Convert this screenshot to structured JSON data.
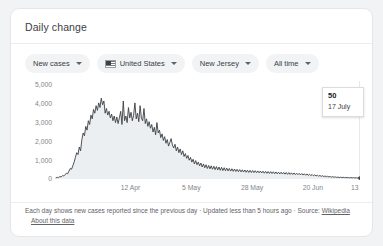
{
  "card": {
    "title": "Daily change"
  },
  "filters": [
    {
      "label": "New cases",
      "icon": null
    },
    {
      "label": "United States",
      "icon": "us-flag-icon"
    },
    {
      "label": "New Jersey",
      "icon": null
    },
    {
      "label": "All time",
      "icon": null
    }
  ],
  "tooltip": {
    "value": "50",
    "date": "17 July"
  },
  "footer": {
    "text": "Each day shows new cases reported since the previous day · Updated less than 5 hours ago ·  Source:",
    "source_link": "Wikipedia",
    "about_link": "About this data"
  },
  "colors": {
    "line": "#3c4043",
    "fill": "#eceff1",
    "axis_text": "#80868b",
    "card_bg": "#ffffff",
    "page_bg": "#f1f3f4",
    "chip_bg": "#f1f3f4"
  },
  "chart_data": {
    "type": "area",
    "title": "Daily change",
    "xlabel": "",
    "ylabel": "",
    "ylim": [
      0,
      5000
    ],
    "yticks": [
      0,
      1000,
      2000,
      3000,
      4000,
      5000
    ],
    "ytick_labels": [
      "0",
      "1,000",
      "2,000",
      "3,000",
      "4,000",
      "5,000"
    ],
    "xtick_labels": [
      "12 Apr",
      "5 May",
      "28 May",
      "20 Jun",
      "13 Jul"
    ],
    "xtick_positions": [
      0.245,
      0.445,
      0.645,
      0.845,
      1.0
    ],
    "grid": false,
    "legend": null,
    "series": [
      {
        "name": "New cases",
        "values": [
          60,
          90,
          75,
          130,
          110,
          180,
          160,
          240,
          300,
          280,
          420,
          560,
          520,
          700,
          900,
          1150,
          1400,
          1300,
          1700,
          1500,
          2100,
          2450,
          2300,
          2800,
          2600,
          3100,
          2900,
          3400,
          3200,
          3700,
          3500,
          3900,
          3650,
          4050,
          3800,
          4300,
          3950,
          4150,
          3500,
          3750,
          3400,
          3600,
          3250,
          3450,
          3100,
          3350,
          3000,
          3300,
          2950,
          3250,
          3600,
          2900,
          4150,
          3100,
          3350,
          3000,
          3800,
          3250,
          3550,
          3100,
          3400,
          4050,
          3200,
          3500,
          3050,
          3900,
          3250,
          3100,
          3750,
          2950,
          3200,
          2800,
          3050,
          2700,
          2900,
          2500,
          2750,
          2350,
          3000,
          2450,
          2600,
          2200,
          2400,
          2050,
          2250,
          1900,
          2100,
          1750,
          1950,
          2150,
          1800,
          1650,
          1850,
          1500,
          1700,
          1400,
          1600,
          1300,
          1500,
          1200,
          1350,
          1100,
          1250,
          1000,
          1150,
          900,
          1050,
          800,
          980,
          760,
          900,
          700,
          850,
          640,
          800,
          600,
          760,
          560,
          720,
          540,
          700,
          520,
          680,
          500,
          660,
          480,
          640,
          460,
          620,
          450,
          600,
          440,
          580,
          430,
          560,
          420,
          545,
          410,
          530,
          400,
          515,
          390,
          500,
          380,
          490,
          370,
          480,
          360,
          470,
          350,
          460,
          345,
          450,
          340,
          440,
          335,
          430,
          330,
          425,
          320,
          415,
          310,
          405,
          300,
          400,
          295,
          390,
          290,
          385,
          280,
          375,
          275,
          365,
          270,
          360,
          265,
          350,
          260,
          345,
          250,
          340,
          245,
          330,
          240,
          320,
          235,
          310,
          230,
          300,
          220,
          290,
          210,
          280,
          200,
          270,
          190,
          255,
          180,
          240,
          170,
          220,
          160,
          205,
          150,
          190,
          140,
          175,
          130,
          160,
          120,
          145,
          110,
          130,
          100,
          120,
          95,
          110,
          85,
          100,
          80,
          95,
          75,
          90,
          70,
          85,
          65,
          80,
          60,
          75,
          58,
          70,
          55,
          68,
          52,
          65,
          50
        ]
      }
    ],
    "highlight_point": {
      "value": 50,
      "label": "17 July"
    }
  }
}
